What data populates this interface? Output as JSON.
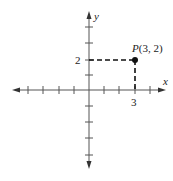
{
  "diagram": {
    "type": "coordinate-plane",
    "axes": {
      "x_label": "x",
      "y_label": "y",
      "x_ticks": [
        -4,
        -3,
        -2,
        -1,
        1,
        2,
        3,
        4
      ],
      "y_ticks": [
        -5,
        -4,
        -3,
        -2,
        -1,
        1,
        2,
        3,
        4
      ],
      "labeled_ticks": {
        "x": "3",
        "y": "2"
      }
    },
    "point": {
      "name": "P",
      "coords_text": "(3, 2)",
      "x": 3,
      "y": 2
    },
    "colors": {
      "axis": "#555555",
      "dashed": "#111111",
      "point": "#111111"
    }
  }
}
